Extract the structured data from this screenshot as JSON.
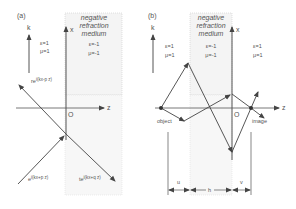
{
  "panels": {
    "a": {
      "label": "(a)",
      "axis_k": "k",
      "axis_x": "x",
      "axis_z": "z",
      "origin": "O",
      "left_medium": {
        "eps": "ε=1",
        "mu": "μ=1"
      },
      "neg_medium": {
        "title_line1": "negative",
        "title_line2": "refraction",
        "title_line3": "medium",
        "eps": "ε=-1",
        "mu": "μ=-1"
      },
      "waves": {
        "reflected": "re",
        "reflected_exp": "i(kx-p z)",
        "incident": "e",
        "incident_exp": "i(kx+p z)",
        "transmitted": "te",
        "transmitted_exp": "i(kx+q z)"
      }
    },
    "b": {
      "label": "(b)",
      "axis_k": "k",
      "axis_x": "x",
      "axis_z": "z",
      "origin": "O",
      "left_medium": {
        "eps": "ε=1",
        "mu": "μ=1"
      },
      "neg_medium": {
        "title_line1": "negative",
        "title_line2": "refraction",
        "title_line3": "medium",
        "eps": "ε=-1",
        "mu": "μ=-1"
      },
      "right_medium": {
        "eps": "ε=1",
        "mu": "μ=1"
      },
      "object_label": "object",
      "image_label": "image",
      "dims": {
        "u": "u",
        "h": "h",
        "v": "v"
      }
    }
  },
  "colors": {
    "line": "#444444",
    "shade": "#f3f3f3",
    "border": "#c8c8c8",
    "text": "#555555"
  }
}
